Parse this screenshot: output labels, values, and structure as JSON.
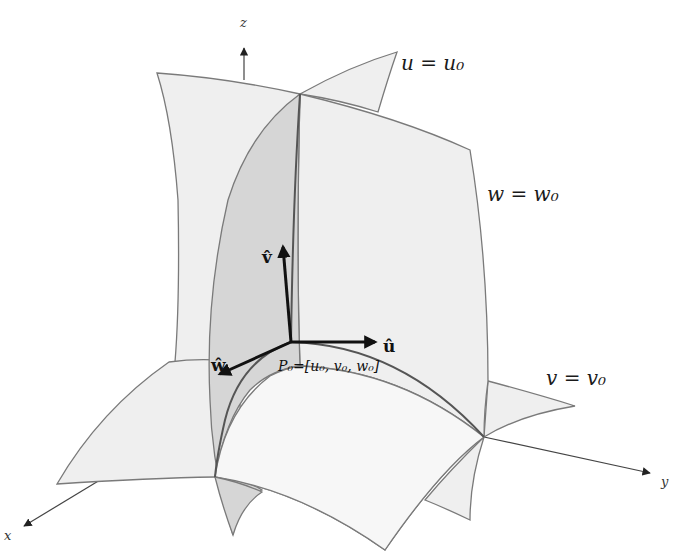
{
  "figure": {
    "axes": {
      "z_label": "z",
      "y_label": "y",
      "x_label": "x"
    },
    "surfaces": [
      {
        "id": "u",
        "label": "u = u₀"
      },
      {
        "id": "w",
        "label": "w = w₀"
      },
      {
        "id": "v",
        "label": "v = v₀"
      }
    ],
    "unit_vectors": [
      {
        "id": "u_hat",
        "label": "û"
      },
      {
        "id": "v_hat",
        "label": "v̂"
      },
      {
        "id": "w_hat",
        "label": "ŵ"
      }
    ],
    "point": {
      "label": "P₀=[u₀, v₀, w₀]"
    },
    "colors": {
      "surface_light": "#efefef",
      "surface_dark": "#d6d6d6",
      "edge": "#7a7a7a",
      "vector": "#111111"
    }
  }
}
